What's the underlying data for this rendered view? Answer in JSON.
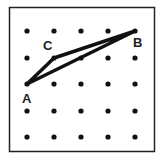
{
  "figure": {
    "type": "geoboard-triangle",
    "grid": {
      "rows": 5,
      "cols": 5,
      "x": [
        27,
        54,
        81,
        108,
        135
      ],
      "y": [
        31,
        58,
        84,
        111,
        137
      ]
    },
    "frame": {
      "x": 9,
      "y": 7,
      "width": 146,
      "height": 145,
      "color": "#222222"
    },
    "points": [
      {
        "label": "A",
        "col": 0,
        "row": 2,
        "label_x": 22,
        "label_y": 103
      },
      {
        "label": "C",
        "col": 1,
        "row": 1,
        "label_x": 43,
        "label_y": 50
      },
      {
        "label": "B",
        "col": 4,
        "row": 0,
        "label_x": 133,
        "label_y": 47
      }
    ],
    "triangle_color": "#111111"
  }
}
